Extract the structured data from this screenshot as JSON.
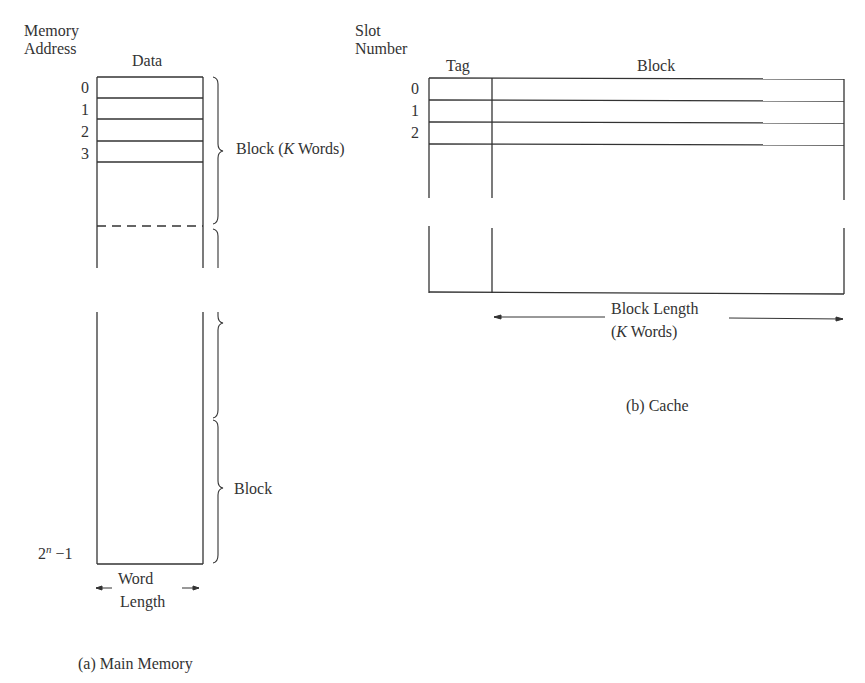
{
  "main_memory": {
    "header_address": [
      "Memory",
      "Address"
    ],
    "header_data": "Data",
    "addresses": [
      "0",
      "1",
      "2",
      "3"
    ],
    "last_address_base": "2",
    "last_address_exp": "n",
    "last_address_suffix": " −1",
    "block_label_prefix": "Block (",
    "block_label_k": "K",
    "block_label_suffix": " Words)",
    "block_label_2": "Block",
    "width_label": [
      "Word",
      "Length"
    ],
    "caption": "(a) Main Memory"
  },
  "cache": {
    "header_slot": [
      "Slot",
      "Number"
    ],
    "header_tag": "Tag",
    "header_block": "Block",
    "slots": [
      "0",
      "1",
      "2"
    ],
    "length_label_1": "Block Length",
    "length_label_2_prefix": "(",
    "length_label_2_k": "K",
    "length_label_2_suffix": " Words)",
    "caption": "(b) Cache"
  }
}
